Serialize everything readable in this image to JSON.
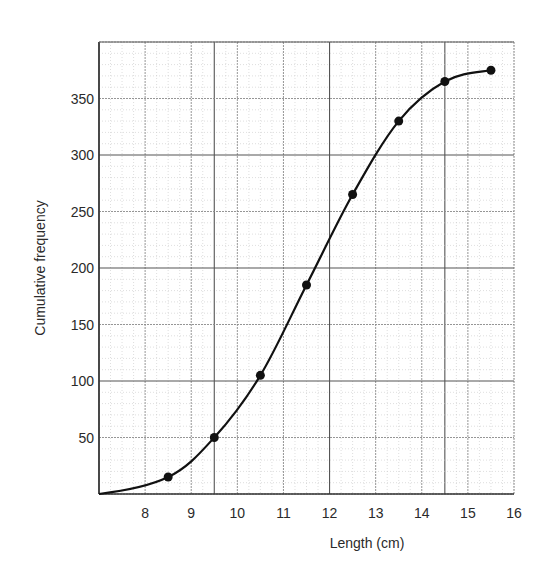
{
  "chart_data": {
    "type": "line",
    "title": "",
    "xlabel": "Length (cm)",
    "ylabel": "Cumulative frequency",
    "xlim": [
      7,
      16
    ],
    "ylim": [
      0,
      400
    ],
    "x_ticks": [
      8,
      9,
      10,
      11,
      12,
      13,
      14,
      15,
      16
    ],
    "y_ticks": [
      50,
      100,
      150,
      200,
      250,
      300,
      350
    ],
    "grid": true,
    "legend": null,
    "series": [
      {
        "name": "Cumulative frequency",
        "x": [
          8.5,
          9.5,
          10.5,
          11.5,
          12.5,
          13.5,
          14.5,
          15.5
        ],
        "values": [
          15,
          50,
          105,
          185,
          265,
          330,
          365,
          375
        ],
        "curve_start": [
          7,
          0
        ],
        "smooth": true,
        "markers": true
      }
    ]
  },
  "colors": {
    "curve": "#111111",
    "grid_minor": "#c8c8c8",
    "grid_major": "#8a8a8a",
    "axis": "#333333"
  }
}
